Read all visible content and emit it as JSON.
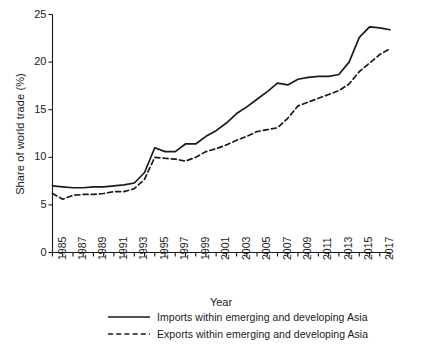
{
  "chart_data": {
    "type": "line",
    "title": "",
    "xlabel": "Year",
    "ylabel": "Share of world trade (%)",
    "xlim": [
      1985,
      2018
    ],
    "ylim": [
      0,
      25
    ],
    "grid": false,
    "legend_position": "below",
    "y_ticks": [
      0,
      5,
      10,
      15,
      20,
      25
    ],
    "y_tick_labels": [
      "0",
      "5",
      "10",
      "15",
      "20",
      "25"
    ],
    "x": [
      1985,
      1986,
      1987,
      1988,
      1989,
      1990,
      1991,
      1992,
      1993,
      1994,
      1995,
      1996,
      1997,
      1998,
      1999,
      2000,
      2001,
      2002,
      2003,
      2004,
      2005,
      2006,
      2007,
      2008,
      2009,
      2010,
      2011,
      2012,
      2013,
      2014,
      2015,
      2016,
      2017,
      2018
    ],
    "x_tick_labels": [
      "1985",
      "1987",
      "1989",
      "1991",
      "1993",
      "1995",
      "1997",
      "1999",
      "2001",
      "2003",
      "2005",
      "2007",
      "2009",
      "2011",
      "2013",
      "2015",
      "2017"
    ],
    "series": [
      {
        "name": "Imports within emerging and developing Asia",
        "style": "solid",
        "color": "#1a1a1a",
        "values": [
          7.0,
          6.9,
          6.8,
          6.8,
          6.9,
          6.9,
          7.0,
          7.1,
          7.3,
          8.4,
          11.0,
          10.6,
          10.6,
          11.4,
          11.4,
          12.2,
          12.8,
          13.6,
          14.6,
          15.3,
          16.1,
          16.9,
          17.8,
          17.6,
          18.2,
          18.4,
          18.5,
          18.5,
          18.7,
          20.0,
          22.6,
          23.7,
          23.6,
          23.4
        ]
      },
      {
        "name": "Exports within emerging and developing Asia",
        "style": "dashed",
        "color": "#1a1a1a",
        "values": [
          6.2,
          5.6,
          6.0,
          6.1,
          6.1,
          6.2,
          6.4,
          6.4,
          6.7,
          7.7,
          10.0,
          9.9,
          9.8,
          9.6,
          10.0,
          10.6,
          10.9,
          11.3,
          11.8,
          12.2,
          12.7,
          12.9,
          13.1,
          14.1,
          15.4,
          15.8,
          16.2,
          16.6,
          17.0,
          17.7,
          19.0,
          19.9,
          20.8,
          21.4
        ]
      }
    ]
  },
  "axes": {
    "ylabel": "Share of world trade (%)",
    "xlabel": "Year"
  },
  "legend": {
    "items": [
      {
        "label": "Imports within emerging and developing Asia",
        "style": "solid"
      },
      {
        "label": "Exports within emerging and developing Asia",
        "style": "dashed"
      }
    ]
  }
}
